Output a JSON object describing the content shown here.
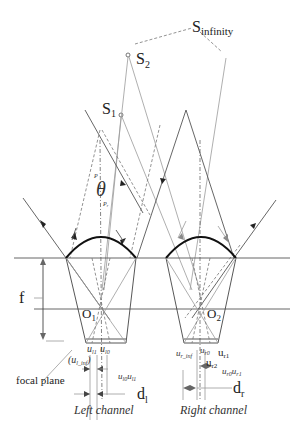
{
  "figure": {
    "labels": {
      "s_infinity_main": "S",
      "s_infinity_sub": "infinity",
      "s2_main": "S",
      "s2_sub": "2",
      "s1_main": "S",
      "s1_sub": "1",
      "theta": "θ",
      "p_l": "P",
      "p_r": "P",
      "p_r_sub": "r",
      "f": "f",
      "o1_main": "O",
      "o1_sub": "1",
      "o2_main": "O",
      "o2_sub": "2",
      "focal_plane": "focal plane",
      "u_l1": "u",
      "u_l1_sub": "l1",
      "u_l0": "u",
      "u_l0_sub": "l0",
      "u_l_inf": "(u",
      "u_l_inf_sub": "l_inf",
      "u_l_inf_close": ")",
      "u_l0_u_l1": "u",
      "u_l0_u_l1_sub_a": "l0",
      "u_l0_u_l1_mid": "u",
      "u_l0_u_l1_sub_b": "l1",
      "d_l_main": "d",
      "d_l_sub": "l",
      "u_r_inf": "u",
      "u_r_inf_sub": "r_inf",
      "u_r0": "u",
      "u_r0_sub": "r0",
      "u_r1": "u",
      "u_r1_sub": "r1",
      "u_r2": "u",
      "u_r2_sub": "r2",
      "u_r0_u_r1": "u",
      "u_r0_u_r1_sub_a": "r0",
      "u_r0_u_r1_mid": "u",
      "u_r0_u_r1_sub_b": "r1",
      "d_r_main": "d",
      "d_r_sub": "r",
      "left_channel": "Left channel",
      "right_channel": "Right channel"
    },
    "colors": {
      "lens": "#111111",
      "ray": "#9a9a9a",
      "ray_dark": "#555555",
      "marker": "#777777"
    }
  }
}
